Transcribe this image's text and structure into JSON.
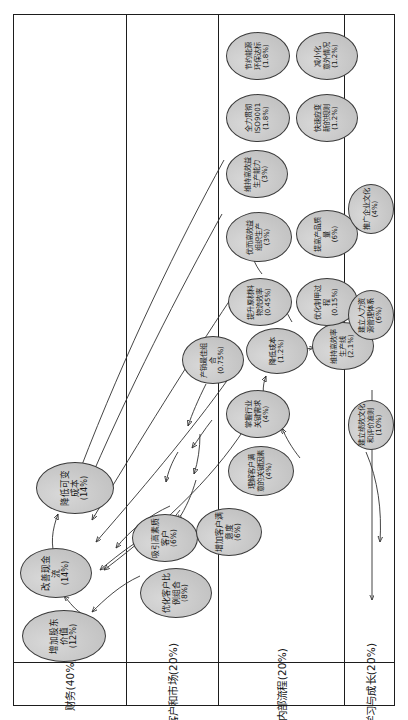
{
  "document": {
    "title": "平衡计分卡战略地图",
    "orientation": "rotated-90-ccw"
  },
  "perspectives": [
    {
      "id": "financial",
      "label": "财务(40%)",
      "weight": "40%"
    },
    {
      "id": "customer",
      "label": "客户和市场(20%)",
      "weight": "20%"
    },
    {
      "id": "internal",
      "label": "内部流程(20%)",
      "weight": "20%"
    },
    {
      "id": "learning",
      "label": "学习与成长(20%)",
      "weight": "20%"
    }
  ],
  "nodes": [
    {
      "id": "n1",
      "perspective": "financial",
      "text": "增加股东价值",
      "value": "(12%)"
    },
    {
      "id": "n2",
      "perspective": "financial",
      "text": "改善现金流",
      "value": "(14%)"
    },
    {
      "id": "n3",
      "perspective": "financial",
      "text": "降低可变成本",
      "value": "(14%)"
    },
    {
      "id": "n4",
      "perspective": "customer",
      "text": "优化客户比例组合",
      "value": "(8%)"
    },
    {
      "id": "n5",
      "perspective": "customer",
      "text": "吸引高素质客户",
      "value": "(6%)"
    },
    {
      "id": "n6",
      "perspective": "customer",
      "text": "增加客户满意度",
      "value": "(6%)"
    },
    {
      "id": "n7",
      "perspective": "internal",
      "text": "理解客户满\n意的关键因素",
      "value": "(4%)"
    },
    {
      "id": "n8",
      "perspective": "internal",
      "text": "掌握行业\n关键需求",
      "value": "(4%)"
    },
    {
      "id": "n9",
      "perspective": "internal",
      "text": "降低成本",
      "value": "(1.2%)"
    },
    {
      "id": "n10",
      "perspective": "internal",
      "text": "维持高效率\n生产线",
      "value": "(2.1%)"
    },
    {
      "id": "n11",
      "perspective": "internal",
      "text": "产销最佳组合",
      "value": "(0.75%)"
    },
    {
      "id": "n12",
      "perspective": "internal",
      "text": "提升原材料\n物流效率",
      "value": "(0.45%)"
    },
    {
      "id": "n13",
      "perspective": "internal",
      "text": "优化制甲过程",
      "value": "(0.15%)"
    },
    {
      "id": "n14",
      "perspective": "internal",
      "text": "优而高效益\n组织生产",
      "value": "(3%)"
    },
    {
      "id": "n15",
      "perspective": "internal",
      "text": "提高产品质量",
      "value": "(6%)"
    },
    {
      "id": "n16",
      "perspective": "internal",
      "text": "维持高效益\n生产能力",
      "value": "(3%)"
    },
    {
      "id": "n17",
      "perspective": "internal",
      "text": "全力贯彻\nISO9001",
      "value": "(1.8%)"
    },
    {
      "id": "n18",
      "perspective": "internal",
      "text": "快速应变\n新的规则",
      "value": "(1.2%)"
    },
    {
      "id": "n19",
      "perspective": "internal",
      "text": "节约能源\n环保达标",
      "value": "(1.8%)"
    },
    {
      "id": "n20",
      "perspective": "internal",
      "text": "减小化\n意外情况",
      "value": "(1.2%)"
    },
    {
      "id": "n21",
      "perspective": "learning",
      "text": "建立绩效文化\n和评价准则",
      "value": "(10%)"
    },
    {
      "id": "n22",
      "perspective": "learning",
      "text": "建立人力资\n源管理体系",
      "value": "(6%)"
    },
    {
      "id": "n23",
      "perspective": "learning",
      "text": "推广企业文化",
      "value": "(4%)"
    }
  ]
}
